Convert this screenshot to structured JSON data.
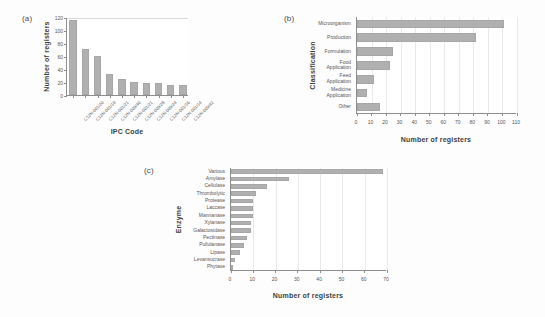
{
  "figure": {
    "background": "#fdfdfd",
    "bar_color": "#b0b0b0",
    "axis_color": "#8d8d8d",
    "panel_a_tag": "(a)",
    "panel_b_tag": "(b)",
    "panel_c_tag": "(c)"
  },
  "chart_data": [
    {
      "id": "a",
      "type": "bar",
      "orientation": "vertical",
      "panel": "(a)",
      "title": "",
      "xlabel": "IPC Code",
      "ylabel": "Number of registers",
      "categories": [
        "C12N-001/20",
        "C12N-001/19",
        "C12N-001/21",
        "C12N-009/40",
        "C12N-001/21",
        "C12N-009/28",
        "C12N-009/24",
        "C12N-001/16",
        "C12N-001/14",
        "C12N-009/42"
      ],
      "values": [
        116,
        71,
        60,
        33,
        25,
        20,
        18,
        18,
        16,
        15
      ],
      "xlim": [
        0,
        10
      ],
      "ylim": [
        0,
        120
      ],
      "yticks": [
        0,
        20,
        40,
        60,
        80,
        100,
        120
      ],
      "grid": false,
      "legend": "none"
    },
    {
      "id": "b",
      "type": "bar",
      "orientation": "horizontal",
      "panel": "(b)",
      "title": "",
      "xlabel": "Number of registers",
      "ylabel": "Classification",
      "categories": [
        "Microorganism",
        "Production",
        "Formulation",
        "Food\nApplication",
        "Feed\nApplication",
        "Medicine\nApplication",
        "Other"
      ],
      "values": [
        101,
        82,
        25,
        23,
        12,
        7,
        16
      ],
      "xlim": [
        0,
        110
      ],
      "xticks": [
        0,
        10,
        20,
        30,
        40,
        50,
        60,
        70,
        80,
        90,
        100,
        110
      ],
      "grid": true,
      "legend": "none"
    },
    {
      "id": "c",
      "type": "bar",
      "orientation": "horizontal",
      "panel": "(c)",
      "title": "",
      "xlabel": "Number of registers",
      "ylabel": "Enzyme",
      "categories": [
        "Various",
        "Amylase",
        "Cellulase",
        "Thrombolytic",
        "Protease",
        "Laccase",
        "Mannanase",
        "Xylanase",
        "Galactosidase",
        "Pectinase",
        "Pullulanase",
        "Lipase",
        "Levansucrase",
        "Phytase"
      ],
      "values": [
        68,
        26,
        16,
        11,
        10,
        10,
        10,
        9,
        9,
        7,
        6,
        4,
        2,
        1
      ],
      "xlim": [
        0,
        70
      ],
      "xticks": [
        0,
        10,
        20,
        30,
        40,
        50,
        60,
        70
      ],
      "grid": true,
      "legend": "none"
    }
  ]
}
